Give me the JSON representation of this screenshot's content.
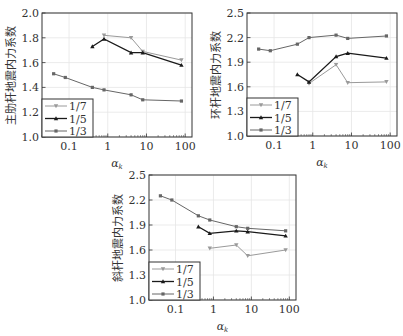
{
  "chart_data": [
    {
      "type": "line",
      "id": "chart-main-rib",
      "title": "",
      "xlabel": "α",
      "xlabel_sub": "k",
      "ylabel": "主肋杆地震内力系数",
      "xscale": "log",
      "xlim": [
        0.02,
        150
      ],
      "xticks": [
        0.1,
        1,
        10,
        100
      ],
      "xtick_labels": [
        "0.1",
        "1",
        "10",
        "100"
      ],
      "ylim": [
        1.0,
        2.0
      ],
      "yticks": [
        1.0,
        1.2,
        1.4,
        1.6,
        1.8,
        2.0
      ],
      "ytick_labels": [
        "1.0",
        "1.2",
        "1.4",
        "1.6",
        "1.8",
        "2.0"
      ],
      "grid": true,
      "legend_position": "lower left",
      "box": {
        "left": 42,
        "top": 13,
        "right": 192,
        "bottom": 137
      },
      "series": [
        {
          "name": "1/7",
          "color": "#9a9a9a",
          "marker": "tri-down",
          "x": [
            0.8,
            4,
            8,
            80
          ],
          "y": [
            1.82,
            1.8,
            1.69,
            1.62
          ]
        },
        {
          "name": "1/5",
          "color": "#1a1a1a",
          "marker": "tri-up",
          "x": [
            0.4,
            0.8,
            4,
            8,
            80
          ],
          "y": [
            1.73,
            1.79,
            1.68,
            1.68,
            1.58
          ]
        },
        {
          "name": "1/3",
          "color": "#666666",
          "marker": "square",
          "x": [
            0.04,
            0.08,
            0.4,
            0.8,
            4,
            8,
            80
          ],
          "y": [
            1.51,
            1.48,
            1.4,
            1.38,
            1.34,
            1.3,
            1.29
          ]
        }
      ]
    },
    {
      "type": "line",
      "id": "chart-ring",
      "title": "",
      "xlabel": "α",
      "xlabel_sub": "k",
      "ylabel": "环杆地震内力系数",
      "xscale": "log",
      "xlim": [
        0.02,
        150
      ],
      "xticks": [
        0.1,
        1,
        10,
        100
      ],
      "xtick_labels": [
        "0.1",
        "1",
        "10",
        "100"
      ],
      "ylim": [
        1.0,
        2.5
      ],
      "yticks": [
        1.0,
        1.3,
        1.6,
        1.9,
        2.2,
        2.5
      ],
      "ytick_labels": [
        "1.0",
        "1.3",
        "1.6",
        "1.9",
        "2.2",
        "2.5"
      ],
      "grid": true,
      "legend_position": "lower left",
      "box": {
        "left": 247,
        "top": 13,
        "right": 397,
        "bottom": 136
      },
      "series": [
        {
          "name": "1/7",
          "color": "#9a9a9a",
          "marker": "tri-down",
          "x": [
            0.8,
            4,
            8,
            80
          ],
          "y": [
            1.64,
            1.87,
            1.65,
            1.66
          ]
        },
        {
          "name": "1/5",
          "color": "#1a1a1a",
          "marker": "tri-up",
          "x": [
            0.4,
            0.8,
            4,
            8,
            80
          ],
          "y": [
            1.75,
            1.66,
            1.97,
            2.01,
            1.95
          ]
        },
        {
          "name": "1/3",
          "color": "#666666",
          "marker": "square",
          "x": [
            0.04,
            0.08,
            0.4,
            0.8,
            4,
            8,
            80
          ],
          "y": [
            2.06,
            2.04,
            2.12,
            2.2,
            2.23,
            2.19,
            2.22
          ]
        }
      ]
    },
    {
      "type": "line",
      "id": "chart-diagonal",
      "title": "",
      "xlabel": "α",
      "xlabel_sub": "k",
      "ylabel": "斜杆地震内力系数",
      "xscale": "log",
      "xlim": [
        0.02,
        150
      ],
      "xticks": [
        0.1,
        1,
        10,
        100
      ],
      "xtick_labels": [
        "0.1",
        "1",
        "10",
        "100"
      ],
      "ylim": [
        1.0,
        2.5
      ],
      "yticks": [
        1.0,
        1.3,
        1.6,
        1.9,
        2.2,
        2.5
      ],
      "ytick_labels": [
        "1.0",
        "1.3",
        "1.6",
        "1.9",
        "2.2",
        "2.5"
      ],
      "grid": true,
      "legend_position": "lower left",
      "box": {
        "left": 149,
        "top": 175,
        "right": 296,
        "bottom": 300
      },
      "series": [
        {
          "name": "1/7",
          "color": "#9a9a9a",
          "marker": "tri-down",
          "x": [
            0.8,
            4,
            8,
            80
          ],
          "y": [
            1.62,
            1.66,
            1.53,
            1.6
          ]
        },
        {
          "name": "1/5",
          "color": "#1a1a1a",
          "marker": "tri-up",
          "x": [
            0.4,
            0.8,
            4,
            8,
            80
          ],
          "y": [
            1.88,
            1.8,
            1.83,
            1.82,
            1.77
          ]
        },
        {
          "name": "1/3",
          "color": "#666666",
          "marker": "square",
          "x": [
            0.04,
            0.08,
            0.4,
            0.8,
            4,
            8,
            80
          ],
          "y": [
            2.25,
            2.2,
            2.01,
            1.96,
            1.88,
            1.86,
            1.83
          ]
        }
      ]
    }
  ]
}
